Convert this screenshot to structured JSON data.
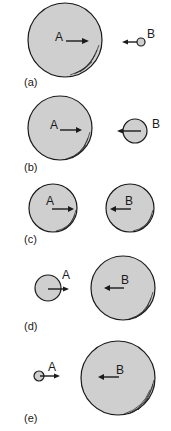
{
  "figure": {
    "panels": [
      {
        "id": "a",
        "label": "(a)",
        "ball_a": {
          "label": "A",
          "cx": 65,
          "cy": 40,
          "r": 37
        },
        "ball_b": {
          "label": "B",
          "cx": 141,
          "cy": 42,
          "r": 4
        }
      },
      {
        "id": "b",
        "label": "(b)",
        "ball_a": {
          "label": "A",
          "cx": 60,
          "cy": 128,
          "r": 32
        },
        "ball_b": {
          "label": "B",
          "cx": 135,
          "cy": 131,
          "r": 12
        }
      },
      {
        "id": "c",
        "label": "(c)",
        "ball_a": {
          "label": "A",
          "cx": 53,
          "cy": 208,
          "r": 24
        },
        "ball_b": {
          "label": "B",
          "cx": 130,
          "cy": 208,
          "r": 24
        }
      },
      {
        "id": "d",
        "label": "(d)",
        "ball_a": {
          "label": "A",
          "cx": 48,
          "cy": 288,
          "r": 13
        },
        "ball_b": {
          "label": "B",
          "cx": 123,
          "cy": 288,
          "r": 32
        }
      },
      {
        "id": "e",
        "label": "(e)",
        "ball_a": {
          "label": "A",
          "cx": 39,
          "cy": 376,
          "r": 5
        },
        "ball_b": {
          "label": "B",
          "cx": 118,
          "cy": 378,
          "r": 37
        }
      }
    ]
  },
  "colors": {
    "ball_fill": "#cfcfcf",
    "outline": "#1a1a1a",
    "background": "#ffffff"
  }
}
